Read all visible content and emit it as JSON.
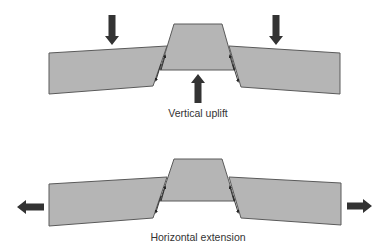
{
  "colors": {
    "block_fill": "#b5b5b5",
    "block_stroke": "#5a5a5a",
    "arrow": "#333333",
    "text": "#333333"
  },
  "diagrams": [
    {
      "id": "vertical-uplift",
      "caption": "Vertical uplift",
      "caption_pos": [
        198,
        107
      ],
      "blocks": {
        "left": [
          [
            49,
            53
          ],
          [
            167,
            46
          ],
          [
            153,
            86
          ],
          [
            49,
            94
          ]
        ],
        "center": [
          [
            174,
            24
          ],
          [
            222,
            24
          ],
          [
            235,
            70
          ],
          [
            160,
            70
          ]
        ],
        "right": [
          [
            229,
            46
          ],
          [
            340,
            53
          ],
          [
            340,
            94
          ],
          [
            241,
            87
          ]
        ]
      },
      "force_arrows": [
        {
          "name": "down-arrow-left",
          "direction": "down",
          "x": 112,
          "y1": 15,
          "y2": 45
        },
        {
          "name": "down-arrow-right",
          "direction": "down",
          "x": 276,
          "y1": 15,
          "y2": 45
        },
        {
          "name": "up-arrow-center",
          "direction": "up",
          "x": 198,
          "y1": 103,
          "y2": 74
        }
      ]
    },
    {
      "id": "horizontal-extension",
      "caption": "Horizontal extension",
      "caption_pos": [
        198,
        231
      ],
      "blocks": {
        "left": [
          [
            49,
            184
          ],
          [
            167,
            177
          ],
          [
            153,
            218
          ],
          [
            49,
            226
          ]
        ],
        "center": [
          [
            174,
            159
          ],
          [
            222,
            159
          ],
          [
            235,
            201
          ],
          [
            160,
            201
          ]
        ],
        "right": [
          [
            229,
            177
          ],
          [
            341,
            183
          ],
          [
            341,
            225
          ],
          [
            241,
            218
          ]
        ]
      },
      "force_arrows": [
        {
          "name": "left-arrow",
          "direction": "left",
          "y": 207,
          "x1": 44,
          "x2": 17
        },
        {
          "name": "right-arrow",
          "direction": "right",
          "y": 206,
          "x1": 347,
          "x2": 372
        }
      ]
    }
  ]
}
